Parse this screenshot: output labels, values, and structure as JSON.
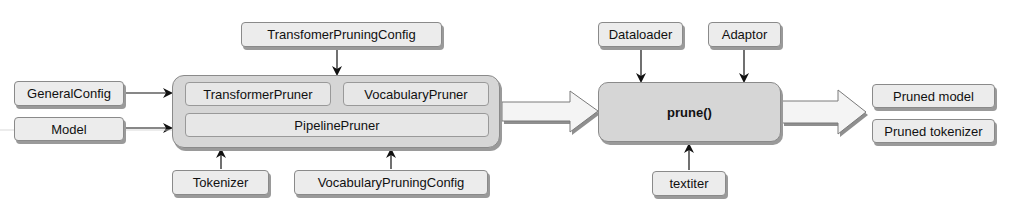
{
  "inputs_left": {
    "general_config": "GeneralConfig",
    "model": "Model"
  },
  "top_config": "TransfomerPruningConfig",
  "pruner_container": {
    "transformer_pruner": "TransformerPruner",
    "vocabulary_pruner": "VocabularyPruner",
    "pipeline_pruner": "PipelinePruner"
  },
  "bottom_inputs": {
    "tokenizer": "Tokenizer",
    "vocabulary_pruning_config": "VocabularyPruningConfig"
  },
  "prune_function": {
    "label": "prune()",
    "dataloader": "Dataloader",
    "adaptor": "Adaptor",
    "textiter": "textiter"
  },
  "outputs": {
    "pruned_model": "Pruned model",
    "pruned_tokenizer": "Pruned tokenizer"
  }
}
